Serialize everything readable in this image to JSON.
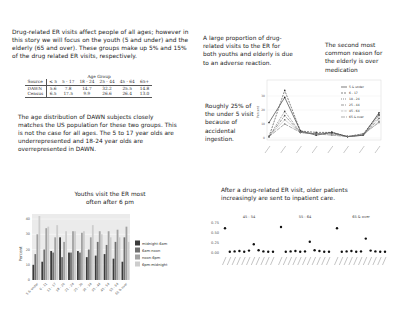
{
  "panel1": {
    "text": "Drug-related ER visits affect people of all ages; however in this story we will focus on the youth (5 and under) and the elderly (65 and over). These groups make up 5% and 15% of the drug related ER visits, respectively.",
    "table": {
      "group_header": "Age Group",
      "columns": [
        "Source",
        "≤ 5",
        "5 - 17",
        "18 - 24",
        "25 - 44",
        "45 - 64",
        "65+"
      ],
      "rows": [
        {
          "source": "DAWN",
          "values": [
            "5.6",
            "7.8",
            "14.7",
            "32.2",
            "25.5",
            "14.8"
          ]
        },
        {
          "source": "Census",
          "values": [
            "6.5",
            "17.5",
            "9.9",
            "26.6",
            "26.4",
            "13.0"
          ]
        }
      ]
    },
    "text2": "The age distribution of DAWN subjects closely matches the US population for these two groups. This is not the case for all ages. The 5 to 17 year olds are underrepresented and 18-24 year olds are overrepresented in DAWN."
  },
  "panel2": {
    "annotation1": "A large proportion of drug-related visits to the ER for both youths and elderly is due to an adverse reaction.",
    "annotation2": "The second most common reason for the elderly is over medication",
    "annotation3": "Roughly 25% of the under 5 visit because of accidental ingestion."
  },
  "panel3": {
    "title": "Youths visit the ER most often after 6 pm"
  },
  "panel4": {
    "title": "After a drug-related ER visit, older patients increasingly are sent to inpatient care."
  },
  "chart_data": [
    {
      "type": "line",
      "title": "",
      "xlabel": "",
      "ylabel": "Percent",
      "ylim": [
        0,
        40
      ],
      "yticks": [
        0,
        10,
        20,
        30
      ],
      "categories": [
        "c1",
        "c2",
        "c3",
        "c4",
        "c5",
        "c6",
        "c7",
        "c8"
      ],
      "legend_position": "top-right inset",
      "series": [
        {
          "name": "5 & under",
          "values": [
            11,
            29,
            5,
            2,
            4,
            1,
            2,
            18
          ]
        },
        {
          "name": "6 - 17",
          "values": [
            1,
            34,
            5,
            4,
            4,
            1,
            3,
            17
          ]
        },
        {
          "name": "18 - 24",
          "values": [
            1,
            19,
            4,
            3,
            4,
            1,
            2,
            16
          ]
        },
        {
          "name": "25 - 44",
          "values": [
            1,
            16,
            4,
            3,
            3,
            1,
            2,
            14
          ]
        },
        {
          "name": "45 - 64",
          "values": [
            1,
            13,
            4,
            3,
            3,
            1,
            2,
            12
          ]
        },
        {
          "name": "65 & over",
          "values": [
            1,
            10,
            4,
            3,
            2,
            1,
            3,
            11
          ]
        }
      ]
    },
    {
      "type": "bar",
      "title": "Youths visit the ER most often after 6 pm",
      "xlabel": "",
      "ylabel": "Percent",
      "ylim": [
        0,
        42
      ],
      "yticks": [
        0,
        10,
        20,
        30,
        40
      ],
      "grid": true,
      "categories": [
        "5 & under",
        "6 - 11",
        "12 - 17",
        "18 - 20",
        "21 - 24",
        "25 - 29",
        "30 - 34",
        "35 - 44",
        "45 - 54",
        "55 - 64",
        "65 & over"
      ],
      "series": [
        {
          "name": "midnight-6am",
          "color": "#3a3a3a",
          "values": [
            10,
            12,
            19,
            28,
            18,
            19,
            15,
            16,
            17,
            14,
            12
          ]
        },
        {
          "name": "6am-noon",
          "color": "#707070",
          "values": [
            17,
            20,
            18,
            15,
            18,
            18,
            20,
            25,
            23,
            25,
            28
          ]
        },
        {
          "name": "noon-6pm",
          "color": "#a2a2a2",
          "values": [
            30,
            34,
            28,
            25,
            32,
            31,
            28,
            32,
            32,
            33,
            35
          ]
        },
        {
          "name": "6pm-midnight",
          "color": "#cdcdcd",
          "values": [
            42,
            35,
            36,
            32,
            32,
            32,
            36,
            30,
            28,
            28,
            25
          ]
        }
      ],
      "legend_position": "right"
    },
    {
      "type": "scatter",
      "title": "After a drug-related ER visit, older patients increasingly are sent to inpatient care.",
      "ylabel": "",
      "ylim": [
        0,
        0.75
      ],
      "yticks": [
        "0.00",
        "0.25",
        "0.50",
        "0.75"
      ],
      "facets": [
        {
          "name": "45 - 54",
          "values": [
            0.62,
            0.03,
            0.04,
            0.05,
            0.03,
            0.06,
            0.22,
            0.07,
            0.04,
            0.03,
            0.03
          ]
        },
        {
          "name": "55 - 64",
          "values": [
            0.65,
            0.03,
            0.04,
            0.05,
            0.03,
            0.04,
            0.28,
            0.07,
            0.05,
            0.03,
            0.03
          ]
        },
        {
          "name": "65 & over",
          "values": [
            0.62,
            0.03,
            0.04,
            0.05,
            0.03,
            0.04,
            0.36,
            0.06,
            0.04,
            0.03,
            0.03
          ]
        }
      ]
    }
  ]
}
